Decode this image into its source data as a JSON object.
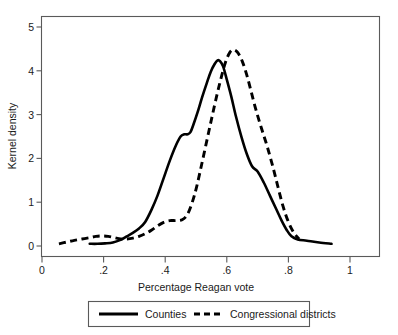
{
  "chart_data": {
    "type": "line",
    "title": "",
    "xlabel": "Percentage Reagan vote",
    "ylabel": "Kernel density",
    "xlim": [
      0,
      1
    ],
    "ylim": [
      0,
      5.2
    ],
    "xticks": [
      "0",
      ".2",
      ".4",
      ".6",
      ".8",
      "1"
    ],
    "xtick_values": [
      0,
      0.2,
      0.4,
      0.6,
      0.8,
      1
    ],
    "yticks": [
      "0",
      "1",
      "2",
      "3",
      "4",
      "5"
    ],
    "ytick_values": [
      0,
      1,
      2,
      3,
      4,
      5
    ],
    "grid": false,
    "legend_position": "below-axis",
    "series": [
      {
        "name": "Counties",
        "style": "solid",
        "color": "#000000",
        "x": [
          0.155,
          0.18,
          0.205,
          0.23,
          0.255,
          0.275,
          0.295,
          0.315,
          0.335,
          0.355,
          0.375,
          0.395,
          0.415,
          0.435,
          0.45,
          0.462,
          0.472,
          0.482,
          0.492,
          0.505,
          0.52,
          0.535,
          0.548,
          0.56,
          0.57,
          0.578,
          0.588,
          0.6,
          0.615,
          0.63,
          0.648,
          0.665,
          0.682,
          0.7,
          0.72,
          0.74,
          0.76,
          0.778,
          0.795,
          0.81,
          0.83,
          0.86,
          0.9,
          0.94
        ],
        "y": [
          0.05,
          0.05,
          0.06,
          0.08,
          0.14,
          0.22,
          0.3,
          0.4,
          0.55,
          0.82,
          1.15,
          1.55,
          1.95,
          2.3,
          2.5,
          2.55,
          2.55,
          2.6,
          2.78,
          3.05,
          3.4,
          3.72,
          3.98,
          4.15,
          4.24,
          4.22,
          4.1,
          3.8,
          3.4,
          2.95,
          2.48,
          2.1,
          1.82,
          1.7,
          1.45,
          1.15,
          0.85,
          0.58,
          0.36,
          0.22,
          0.15,
          0.12,
          0.08,
          0.05
        ]
      },
      {
        "name": "Congressional districts",
        "style": "dashed",
        "color": "#000000",
        "x": [
          0.055,
          0.08,
          0.105,
          0.13,
          0.155,
          0.175,
          0.195,
          0.215,
          0.235,
          0.255,
          0.275,
          0.295,
          0.315,
          0.335,
          0.355,
          0.375,
          0.395,
          0.415,
          0.435,
          0.455,
          0.472,
          0.488,
          0.502,
          0.518,
          0.535,
          0.552,
          0.568,
          0.582,
          0.596,
          0.61,
          0.622,
          0.635,
          0.65,
          0.665,
          0.68,
          0.695,
          0.712,
          0.73,
          0.748,
          0.765,
          0.782,
          0.8,
          0.818,
          0.835
        ],
        "y": [
          0.05,
          0.09,
          0.13,
          0.16,
          0.19,
          0.22,
          0.23,
          0.22,
          0.19,
          0.16,
          0.16,
          0.18,
          0.22,
          0.28,
          0.36,
          0.46,
          0.54,
          0.58,
          0.58,
          0.6,
          0.72,
          1.0,
          1.35,
          1.85,
          2.4,
          2.95,
          3.45,
          3.85,
          4.2,
          4.42,
          4.48,
          4.42,
          4.22,
          3.9,
          3.5,
          3.1,
          2.7,
          2.3,
          1.85,
          1.38,
          0.92,
          0.55,
          0.3,
          0.16
        ]
      }
    ],
    "legend": [
      {
        "label": "Counties",
        "style": "solid"
      },
      {
        "label": "Congressional districts",
        "style": "dashed"
      }
    ]
  },
  "axes": {
    "x_title": "Percentage Reagan vote",
    "y_title": "Kernel density",
    "x_tick_labels": [
      "0",
      ".2",
      ".4",
      ".6",
      ".8",
      "1"
    ],
    "y_tick_labels": [
      "0",
      "1",
      "2",
      "3",
      "4",
      "5"
    ]
  },
  "legend": {
    "counties_label": "Counties",
    "districts_label": "Congressional districts"
  }
}
